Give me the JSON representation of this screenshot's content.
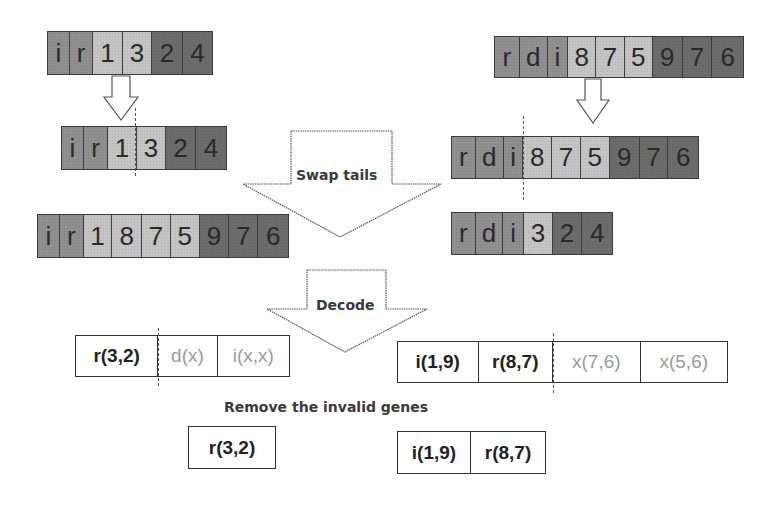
{
  "colors": {
    "cell_mid": "#8f8f8f",
    "cell_light": "#c4c4c4",
    "cell_dark": "#6c6c6c",
    "valid_text": "#222222",
    "invalid_text": "#9a9a9a"
  },
  "parent_left": {
    "cells": [
      "i",
      "r",
      "1",
      "3",
      "2",
      "4"
    ]
  },
  "parent_left_cut": {
    "cells": [
      "i",
      "r",
      "1",
      "3",
      "2",
      "4"
    ]
  },
  "parent_right": {
    "cells": [
      "r",
      "d",
      "i",
      "8",
      "7",
      "5",
      "9",
      "7",
      "6"
    ]
  },
  "parent_right_cut": {
    "cells": [
      "r",
      "d",
      "i",
      "8",
      "7",
      "5",
      "9",
      "7",
      "6"
    ]
  },
  "child_left": {
    "cells": [
      "i",
      "r",
      "1",
      "8",
      "7",
      "5",
      "9",
      "7",
      "6"
    ]
  },
  "child_right": {
    "cells": [
      "r",
      "d",
      "i",
      "3",
      "2",
      "4"
    ]
  },
  "arrows": {
    "swap_label": "Swap tails",
    "decode_label": "Decode"
  },
  "decoded_left": {
    "genes": [
      "r(3,2)",
      "d(x)",
      "i(x,x)"
    ]
  },
  "decoded_right": {
    "genes": [
      "i(1,9)",
      "r(8,7)",
      "x(7,6)",
      "x(5,6)"
    ]
  },
  "caption": "Remove the invalid genes",
  "final_left": {
    "genes": [
      "r(3,2)"
    ]
  },
  "final_right": {
    "genes": [
      "i(1,9)",
      "r(8,7)"
    ]
  }
}
